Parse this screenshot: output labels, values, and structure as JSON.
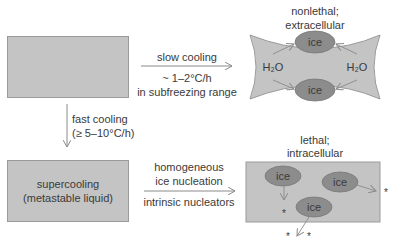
{
  "diagram": {
    "start_box": {
      "label": ""
    },
    "slow_path": {
      "above": "slow cooling",
      "below_line1": "~ 1–2°C/h",
      "below_line2": "in subfreezing range"
    },
    "fast_path": {
      "line1": "fast cooling",
      "line2": "(≥ 5–10°C/h)"
    },
    "supercooling_box": {
      "line1": "supercooling",
      "line2": "(metastable liquid)"
    },
    "nucleation_path": {
      "above_line1": "homogeneous",
      "above_line2": "ice nucleation",
      "below": "intrinsic nucleators"
    },
    "extracellular": {
      "title_line1": "nonlethal;",
      "title_line2": "extracellular",
      "ice_top": "ice",
      "ice_bottom": "ice",
      "water_left": "H₂O",
      "water_right": "H₂O"
    },
    "intracellular": {
      "title_line1": "lethal;",
      "title_line2": "intracellular",
      "ice_1": "ice",
      "ice_2": "ice",
      "ice_3": "ice",
      "damage_marker": "*"
    },
    "colors": {
      "box_fill": "#c4c4c4",
      "box_border": "#9a9a9a",
      "ice_fill": "#8c8c8c",
      "arrow": "#8a8a8a",
      "text": "#3a3a3a"
    }
  }
}
